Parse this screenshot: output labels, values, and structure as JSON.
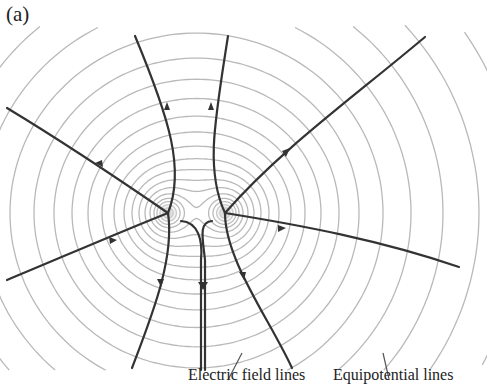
{
  "figure": {
    "panel_label": "(a)",
    "labels": {
      "field_lines": "Electric field lines",
      "equipotential_lines": "Equipotential lines"
    },
    "charges": [
      {
        "name": "left-charge",
        "x": 168,
        "y": 213
      },
      {
        "name": "right-charge",
        "x": 225,
        "y": 213
      }
    ],
    "colors": {
      "field_line": "#333333",
      "equipotential": "#b9b9b9",
      "text": "#222222"
    }
  }
}
